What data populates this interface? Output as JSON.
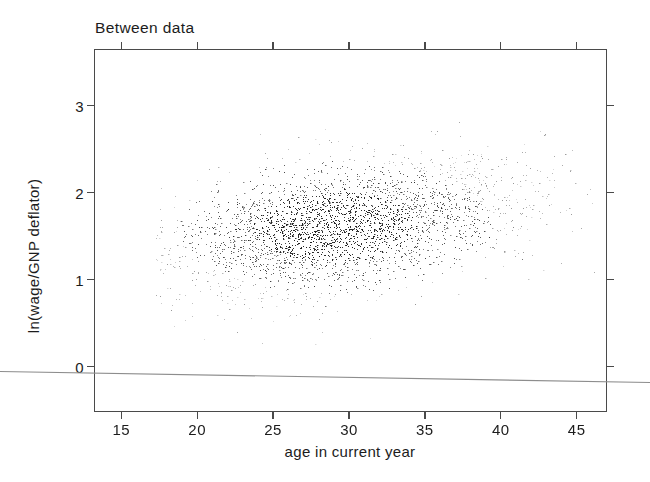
{
  "figure": {
    "title": "Between data",
    "background": "#ffffff",
    "frame_color": "#4a4a4a",
    "point_color": "#2b2b2b",
    "artifact_color": "#8d8d8d"
  },
  "axes": {
    "xlabel": "age in current year",
    "ylabel": "ln(wage/GNP deflator)",
    "xticks": [
      15,
      20,
      25,
      30,
      35,
      40,
      45
    ],
    "yticks": [
      0,
      1,
      2,
      3
    ],
    "xtick_labels": [
      "15",
      "20",
      "25",
      "30",
      "35",
      "40",
      "45"
    ],
    "ytick_labels": [
      "0",
      "1",
      "2",
      "3"
    ],
    "xlim": [
      13.2,
      47.0
    ],
    "ylim": [
      -0.52,
      3.65
    ],
    "tick_direction": "out",
    "ticks_all_sides": true,
    "grid": false
  },
  "chart_data": {
    "type": "scatter",
    "title": "Between data",
    "xlabel": "age in current year",
    "ylabel": "ln(wage/GNP deflator)",
    "xlim": [
      13.2,
      47.0
    ],
    "ylim": [
      -0.52,
      3.65
    ],
    "grid": false,
    "legend": null,
    "marker": {
      "shape": "point",
      "size_px": 1,
      "color": "#2b2b2b"
    },
    "n_points": 3000,
    "distribution": {
      "x_mean": 29.0,
      "x_sd": 5.2,
      "x_min": 17.2,
      "x_max": 46.2,
      "y_intercept": 0.86,
      "y_slope_per_year": 0.026,
      "y_residual_sd": 0.34,
      "y_min": 0.22,
      "y_max": 3.38,
      "correlation": 0.32
    },
    "density_summary": {
      "x_bin_edges": [
        15,
        17.5,
        20,
        22.5,
        25,
        27.5,
        30,
        32.5,
        35,
        37.5,
        40,
        42.5,
        45,
        47.5
      ],
      "counts": [
        0,
        38,
        150,
        285,
        420,
        520,
        505,
        395,
        290,
        185,
        110,
        62,
        30,
        10
      ]
    },
    "y_density_summary": {
      "y_bin_edges": [
        0.0,
        0.4,
        0.8,
        1.2,
        1.6,
        2.0,
        2.4,
        2.8,
        3.2,
        3.6
      ],
      "counts": [
        12,
        70,
        300,
        720,
        880,
        610,
        290,
        95,
        23
      ]
    }
  },
  "artifact": {
    "name": "scan-line",
    "x1": 0,
    "y1": 371.5,
    "x2": 650,
    "y2": 382.5,
    "color": "#8d8d8d",
    "width": 1.1
  }
}
